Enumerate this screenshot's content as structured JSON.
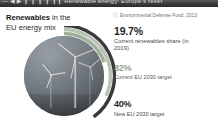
{
  "header": {
    "bar_text": "— ◀ ▶ ❙ ❙ ❙ ❙ ❙❙ Renewable energy: Europe's reset",
    "bar_color": "#3d3d3d"
  },
  "title": {
    "emphasis": "Renewables",
    "rest": " in the",
    "line2": "EU energy mix"
  },
  "source": {
    "mark": "ⓒ",
    "text": "Environmental Defense Fund, 2013"
  },
  "chart_data": {
    "type": "pie",
    "title": "Renewables in the EU energy mix",
    "xlabel": "",
    "ylabel": "Share of EU energy mix (%)",
    "categories": [
      "Current renewables share (in 2019)",
      "Current EU 2030 target",
      "New EU 2030 target"
    ],
    "values": [
      19.7,
      32,
      40
    ],
    "value_labels": [
      "19.7%",
      "32%",
      "40%"
    ],
    "colors": [
      "#9fb09c",
      "#b9c4b6",
      "#3a3a3a"
    ],
    "ylim": [
      0,
      100
    ],
    "grid": false,
    "legend": "right",
    "annotations": [
      "Environmental Defense Fund, 2013"
    ],
    "note": "Three concentric arcs sweeping clockwise from 12 o'clock around a circular wind-turbine photograph; arc length encodes percent of a full circle."
  },
  "stats": [
    {
      "value": "19.7%",
      "label": "Current renewables share (in 2019)",
      "color": "#1f1f1f",
      "percent": 19.7
    },
    {
      "value": "32%",
      "label": "Current EU 2030 target",
      "color": "#8fa38c",
      "percent": 32
    },
    {
      "value": "40%",
      "label": "New EU 2030 target",
      "color": "#1f1f1f",
      "percent": 40
    }
  ],
  "photo": {
    "alt_name": "wind-turbines-photo"
  }
}
